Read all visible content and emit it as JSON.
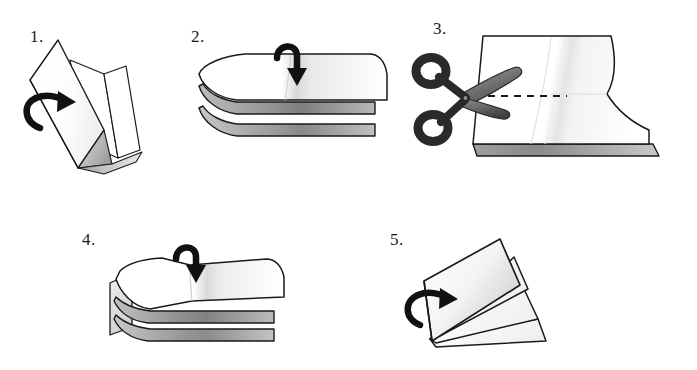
{
  "document": {
    "title": "Paper Folding and Cutting Instructions",
    "type": "instructional-diagram",
    "background_color": "#ffffff",
    "width": 697,
    "height": 370
  },
  "palette": {
    "outline": "#1a1a1a",
    "paper_white": "#ffffff",
    "shade_light": "#f2f2f2",
    "shade_mid": "#c9c9c9",
    "shade_dark": "#8d8d8d",
    "edge_grey": "#a8a8a8",
    "arrow": "#111111",
    "scissors_dark": "#2a2a2a",
    "scissors_blade": "#6e7072",
    "dash_line": "#1a1a1a"
  },
  "steps": [
    {
      "id": "step-1",
      "number": "1.",
      "description": "Folded sheet standing upright, arrow curls around the left fold edge",
      "arrow": "curved-arrow-right",
      "icons": [
        "folded-paper-upright",
        "curved-fold-arrow"
      ]
    },
    {
      "id": "step-2",
      "number": "2.",
      "description": "Folded stack lying flat, hook arrow pointing down at the centre crease",
      "arrow": "hook-arrow-down",
      "icons": [
        "folded-paper-stack-flat",
        "hook-fold-arrow"
      ]
    },
    {
      "id": "step-3",
      "number": "3.",
      "description": "Open sheet with scissors cutting along a dashed line toward the centre crease",
      "arrow": "none",
      "icons": [
        "open-paper-sheet",
        "scissors-icon",
        "dashed-cut-line"
      ]
    },
    {
      "id": "step-4",
      "number": "4.",
      "description": "Cut stack opened flat, hook arrow pointing down at the centre crease",
      "arrow": "hook-arrow-down",
      "icons": [
        "opened-cut-stack",
        "hook-fold-arrow"
      ]
    },
    {
      "id": "step-5",
      "number": "5.",
      "description": "Finished booklet standing with pages fanned, arrow curls around the spine",
      "arrow": "curved-arrow-right",
      "icons": [
        "finished-booklet",
        "curved-fold-arrow"
      ]
    }
  ]
}
